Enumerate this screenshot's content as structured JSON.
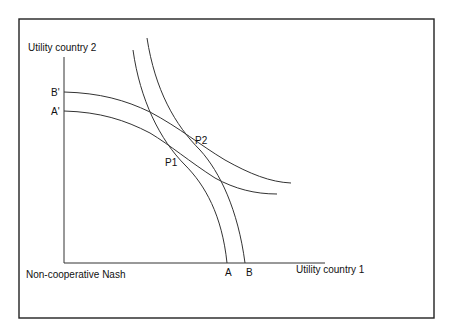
{
  "diagram": {
    "title": "",
    "axes": {
      "y_label": "Utility country 2",
      "x_label": "Utility country 1",
      "origin_label": "Non-cooperative Nash"
    },
    "points": {
      "b_prime": "B'",
      "a_prime": "A'",
      "a": "A",
      "b": "B",
      "p1": "P1",
      "p2": "P2"
    },
    "curves": [
      {
        "name": "frontier-A",
        "from": "top",
        "to": "A",
        "description": "Country 1 reaction/utility curve ending at A"
      },
      {
        "name": "frontier-B",
        "from": "top",
        "to": "B",
        "description": "Country 1 curve ending at B"
      },
      {
        "name": "frontier-A-prime",
        "from": "A'",
        "to": "right",
        "description": "Country 2 curve starting at A'"
      },
      {
        "name": "frontier-B-prime",
        "from": "B'",
        "to": "right",
        "description": "Country 2 curve starting at B'"
      }
    ],
    "intersections": [
      {
        "label": "P1",
        "curves": [
          "frontier-A",
          "frontier-A-prime"
        ]
      },
      {
        "label": "P2",
        "curves": [
          "frontier-B",
          "frontier-B-prime"
        ]
      }
    ],
    "colors": {
      "line": "#333333",
      "frame": "#222222",
      "background": "#ffffff",
      "text": "#111111"
    }
  }
}
